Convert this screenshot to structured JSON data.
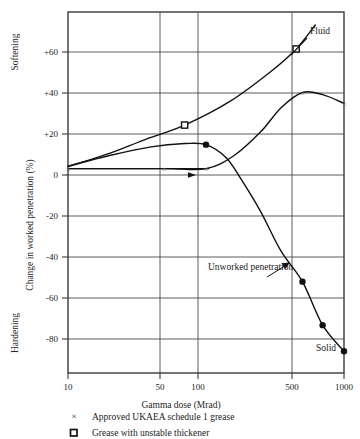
{
  "chart_data": {
    "type": "line",
    "title": "",
    "xlabel": "Gamma dose (Mrad)",
    "ylabel": "Change in worked penetration (%)",
    "xscale": "log",
    "xlim": [
      10,
      1000
    ],
    "ylim": [
      -94,
      72
    ],
    "xticks": [
      10,
      50,
      100,
      500,
      1000
    ],
    "xtick_labels": [
      "10",
      "50",
      "100",
      "500",
      "1000"
    ],
    "yticks": [
      60,
      40,
      20,
      0,
      -20,
      -40,
      -60,
      -80
    ],
    "ytick_labels": [
      "+60",
      "+40",
      "+20",
      "0",
      "-20",
      "-40",
      "-60",
      "-80"
    ],
    "grid": true,
    "legend_position": "below-axis",
    "axis_end_labels": {
      "top": "Softening",
      "bottom": "Hardening"
    },
    "series": [
      {
        "name": "Grease with unstable thickener",
        "marker": "open-square",
        "points": [
          {
            "x": 10,
            "y": 1
          },
          {
            "x": 20,
            "y": 7
          },
          {
            "x": 35,
            "y": 13
          },
          {
            "x": 70,
            "y": 20
          },
          {
            "x": 150,
            "y": 31
          },
          {
            "x": 300,
            "y": 45
          },
          {
            "x": 450,
            "y": 55
          },
          {
            "x": 620,
            "y": 66
          }
        ],
        "marker_points": [
          {
            "x": 70,
            "y": 20
          },
          {
            "x": 450,
            "y": 55
          }
        ],
        "end_label": "Fluid"
      },
      {
        "name": "Approved UKAEA schedule 1 grease",
        "marker": "cross",
        "points": [
          {
            "x": 10,
            "y": 0
          },
          {
            "x": 50,
            "y": 0
          },
          {
            "x": 100,
            "y": 0
          },
          {
            "x": 160,
            "y": 6
          },
          {
            "x": 250,
            "y": 17
          },
          {
            "x": 350,
            "y": 28
          },
          {
            "x": 500,
            "y": 35
          },
          {
            "x": 700,
            "y": 34
          },
          {
            "x": 1000,
            "y": 30
          }
        ],
        "marker_points": [
          {
            "x": 10,
            "y": 0
          },
          {
            "x": 50,
            "y": 0
          },
          {
            "x": 100,
            "y": 0
          },
          {
            "x": 500,
            "y": 35
          },
          {
            "x": 1000,
            "y": 30
          }
        ]
      },
      {
        "name": "Unworked penetration",
        "marker": "filled-circle",
        "points": [
          {
            "x": 10,
            "y": 1
          },
          {
            "x": 20,
            "y": 6
          },
          {
            "x": 40,
            "y": 10
          },
          {
            "x": 70,
            "y": 11.5
          },
          {
            "x": 100,
            "y": 11
          },
          {
            "x": 140,
            "y": 5
          },
          {
            "x": 180,
            "y": -5
          },
          {
            "x": 250,
            "y": -20
          },
          {
            "x": 350,
            "y": -38
          },
          {
            "x": 500,
            "y": -52
          },
          {
            "x": 700,
            "y": -72
          },
          {
            "x": 1000,
            "y": -84
          }
        ],
        "marker_points": [
          {
            "x": 100,
            "y": 11
          },
          {
            "x": 500,
            "y": -52
          },
          {
            "x": 700,
            "y": -72
          },
          {
            "x": 1000,
            "y": -84
          }
        ],
        "end_label": "Solid",
        "annotation": "Unworked\npenetration"
      },
      {
        "name": "baseline zero line",
        "marker": "none",
        "points": [
          {
            "x": 10,
            "y": 0
          },
          {
            "x": 105,
            "y": 0
          }
        ],
        "marker_points": []
      }
    ],
    "annotations": [
      {
        "text": "Fluid",
        "x": 700,
        "y": 68
      },
      {
        "text": "Unworked penetration",
        "x": 210,
        "y": -49
      },
      {
        "text": "Solid",
        "x": 820,
        "y": -88
      }
    ],
    "legend": [
      {
        "symbol": "cross",
        "label": "Approved UKAEA schedule 1 grease"
      },
      {
        "symbol": "open-square",
        "label": "Grease with unstable thickener"
      }
    ]
  },
  "colors": {
    "axis": "#3a3a3a",
    "grid": "#4a4a4a",
    "curve": "#111111",
    "text": "#1a1a1a",
    "background": "#ffffff"
  }
}
